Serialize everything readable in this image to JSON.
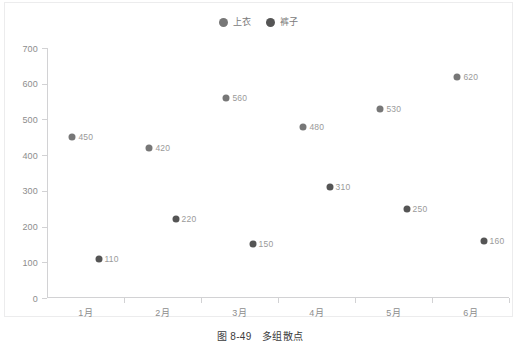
{
  "caption": {
    "number": "图 8-49",
    "title": "多组散点"
  },
  "legend": {
    "items": [
      {
        "label": "上衣",
        "color": "#777777",
        "icon": "circle-marker-icon"
      },
      {
        "label": "裤子",
        "color": "#555555",
        "icon": "circle-marker-icon"
      }
    ]
  },
  "chart_data": {
    "type": "scatter",
    "title": "",
    "subtitle": "",
    "xlabel": "",
    "ylabel": "",
    "categories": [
      "1月",
      "2月",
      "3月",
      "4月",
      "5月",
      "6月"
    ],
    "ylim": [
      0,
      700
    ],
    "yticks": [
      0,
      100,
      200,
      300,
      400,
      500,
      600,
      700
    ],
    "ytick_labels": [
      "0",
      "100",
      "200",
      "300",
      "400",
      "500",
      "600",
      "700"
    ],
    "grid": false,
    "legend_position": "top-center",
    "series": [
      {
        "name": "上衣",
        "color": "#777777",
        "values": [
          450,
          420,
          560,
          480,
          530,
          620
        ],
        "labels": [
          "450",
          "420",
          "560",
          "480",
          "530",
          "620"
        ]
      },
      {
        "name": "裤子",
        "color": "#555555",
        "values": [
          110,
          220,
          150,
          310,
          250,
          160
        ],
        "labels": [
          "110",
          "220",
          "150",
          "310",
          "250",
          "160"
        ]
      }
    ]
  }
}
